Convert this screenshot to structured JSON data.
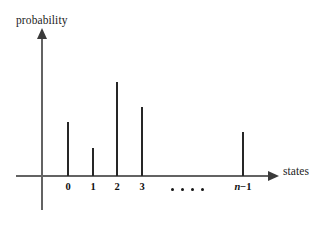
{
  "chart_data": {
    "type": "bar",
    "title": "",
    "xlabel": "states",
    "ylabel": "probability",
    "categories": [
      "0",
      "1",
      "2",
      "3",
      "n−1"
    ],
    "values": [
      0.47,
      0.28,
      0.72,
      0.58,
      0.36
    ],
    "bar_pixel_heights": [
      54,
      28,
      94,
      69,
      44
    ],
    "bar_pixel_x": [
      68,
      93,
      117,
      142,
      243
    ],
    "baseline_y": 176,
    "grid": false,
    "legend": null,
    "annotations": [
      {
        "name": "ellipsis",
        "text": "• • • •",
        "dots": 4
      }
    ],
    "axis_style": {
      "x_axis_arrow": true,
      "y_axis_arrow": true,
      "axis_color": "#636363",
      "bar_color": "#262626"
    }
  },
  "labels": {
    "y_axis_title": "probability",
    "x_axis_title": "states",
    "ticks": [
      {
        "text": "0",
        "math": false
      },
      {
        "text": "1",
        "math": false
      },
      {
        "text": "2",
        "math": false
      },
      {
        "text": "3",
        "math": false
      },
      {
        "text": "n−1",
        "math": true,
        "variable": "n",
        "operator": "−",
        "operand": "1"
      }
    ]
  },
  "colors": {
    "background": "#ffffff",
    "axis": "#636363",
    "arrow": "#3a3a3a",
    "bar": "#262626",
    "text": "#1c1c1c"
  }
}
